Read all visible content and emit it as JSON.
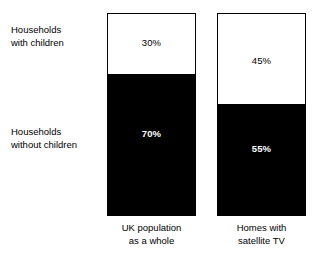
{
  "chart_data": {
    "type": "bar",
    "title": "",
    "subtitle": "",
    "xlabel": "",
    "ylabel": "",
    "stacked": true,
    "units": "percent",
    "ylim": [
      0,
      100
    ],
    "grid": false,
    "legend_position": "left-outside",
    "categories": [
      "UK population as a whole",
      "Homes with satellite TV"
    ],
    "series": [
      {
        "name": "Households with children",
        "color": "#ffffff",
        "values": [
          30,
          45
        ],
        "value_labels": [
          "30%",
          "45%"
        ]
      },
      {
        "name": "Households without children",
        "color": "#000000",
        "values": [
          70,
          55
        ],
        "value_labels": [
          "70%",
          "55%"
        ]
      }
    ]
  },
  "legend": {
    "with_children_label": "Households\nwith children",
    "without_children_label": "Households\nwithout children"
  },
  "bars": {
    "uk": {
      "caption": "UK population\nas a whole",
      "top_value": "30%",
      "bottom_value": "70%",
      "top_percent": 30,
      "bottom_percent": 70
    },
    "satellite": {
      "caption": "Homes with\nsatellite TV",
      "top_value": "45%",
      "bottom_value": "55%",
      "top_percent": 45,
      "bottom_percent": 55
    }
  },
  "colors": {
    "with_children_fill": "#ffffff",
    "without_children_fill": "#000000",
    "outline": "#000000",
    "background": "#ffffff"
  }
}
